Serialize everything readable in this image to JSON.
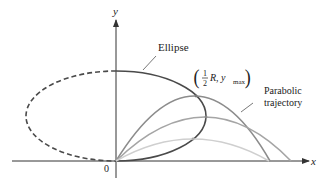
{
  "diagram": {
    "axes": {
      "x_label": "x",
      "y_label": "y",
      "origin_label": "0"
    },
    "labels": {
      "ellipse": "Ellipse",
      "point_open": "(",
      "point_frac_num": "1",
      "point_frac_den": "2",
      "point_R": "R, y",
      "point_sub": "max",
      "point_close": ")",
      "parabolic_line1": "Parabolic",
      "parabolic_line2": "trajectory"
    },
    "colors": {
      "axis": "#333333",
      "ellipse_solid": "#4a4a4a",
      "ellipse_dashed": "#4a4a4a",
      "trajectory_high": "#8c8c8c",
      "trajectory_mid": "#a5a5a5",
      "trajectory_low": "#cfcfcf",
      "trajectory_flat": "#3a3a3a"
    },
    "curves": [
      {
        "name": "ellipse",
        "style": "solid right half, dashed left half"
      },
      {
        "name": "trajectory-high",
        "peak": "(1/2 R, y_max) on ellipse"
      },
      {
        "name": "trajectory-mid"
      },
      {
        "name": "trajectory-low"
      }
    ]
  }
}
